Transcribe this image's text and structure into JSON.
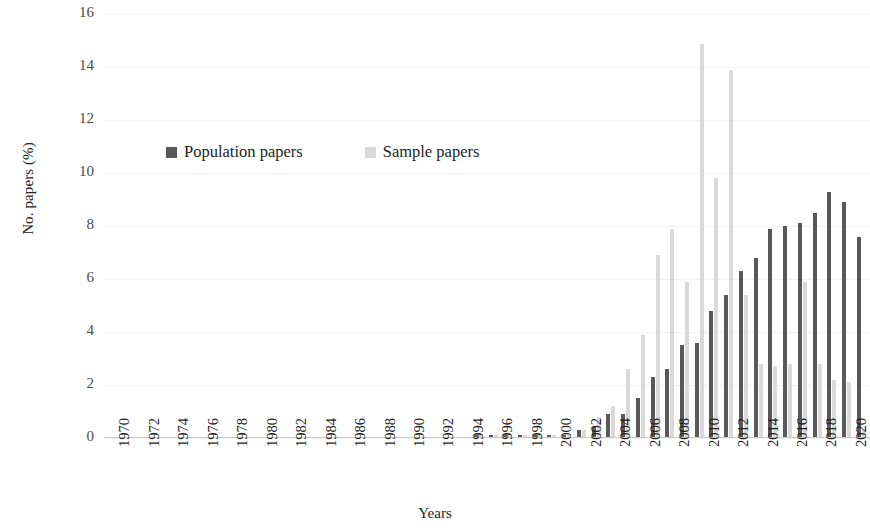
{
  "chart": {
    "type": "bar",
    "ylabel": "No. papers (%)",
    "xlabel": "Years"
  },
  "legend": {
    "position": "inside-top-left",
    "items": [
      {
        "label": "Population papers",
        "color": "#595959",
        "key": "population"
      },
      {
        "label": "Sample papers",
        "color": "#d9d9d9",
        "key": "sample"
      }
    ]
  },
  "yaxis": {
    "ticks": [
      "0",
      "2",
      "4",
      "6",
      "8",
      "10",
      "12",
      "14",
      "16"
    ],
    "min": 0,
    "max": 16,
    "step": 2
  },
  "xaxis": {
    "ticks": [
      "1970",
      "1972",
      "1974",
      "1976",
      "1978",
      "1980",
      "1982",
      "1984",
      "1986",
      "1988",
      "1990",
      "1992",
      "1994",
      "1996",
      "1998",
      "2000",
      "2002",
      "2004",
      "2006",
      "2008",
      "2010",
      "2012",
      "2014",
      "2016",
      "2018",
      "2020"
    ],
    "min": 1970,
    "max": 2021
  },
  "chart_data": {
    "type": "bar",
    "title": "",
    "xlabel": "Years",
    "ylabel": "No. papers (%)",
    "ylim": [
      0,
      16
    ],
    "grid": true,
    "legend_position": "inside-top-left",
    "categories": [
      "1970",
      "1971",
      "1972",
      "1973",
      "1974",
      "1975",
      "1976",
      "1977",
      "1978",
      "1979",
      "1980",
      "1981",
      "1982",
      "1983",
      "1984",
      "1985",
      "1986",
      "1987",
      "1988",
      "1989",
      "1990",
      "1991",
      "1992",
      "1993",
      "1994",
      "1995",
      "1996",
      "1997",
      "1998",
      "1999",
      "2000",
      "2001",
      "2002",
      "2003",
      "2004",
      "2005",
      "2006",
      "2007",
      "2008",
      "2009",
      "2010",
      "2011",
      "2012",
      "2013",
      "2014",
      "2015",
      "2016",
      "2017",
      "2018",
      "2019",
      "2020",
      "2021"
    ],
    "series": [
      {
        "name": "Population papers",
        "color": "#595959",
        "values": [
          0,
          0,
          0,
          0,
          0,
          0,
          0,
          0,
          0,
          0,
          0,
          0,
          0,
          0,
          0,
          0,
          0,
          0,
          0,
          0,
          0,
          0,
          0,
          0,
          0,
          0.1,
          0.1,
          0.1,
          0.1,
          0.1,
          0.1,
          0.1,
          0.3,
          0.4,
          0.9,
          0.9,
          1.5,
          2.3,
          2.6,
          3.5,
          3.6,
          4.8,
          5.4,
          6.3,
          6.8,
          7.9,
          8.0,
          8.1,
          8.5,
          9.3,
          8.9,
          7.6
        ]
      },
      {
        "name": "Sample papers",
        "color": "#d9d9d9",
        "values": [
          0,
          0,
          0,
          0,
          0,
          0,
          0,
          0,
          0,
          0,
          0,
          0,
          0,
          0,
          0,
          0,
          0,
          0,
          0,
          0,
          0,
          0,
          0,
          0,
          0,
          0.1,
          0.1,
          0.1,
          0.1,
          0.1,
          0.1,
          0.1,
          0.3,
          0.8,
          1.2,
          2.6,
          3.9,
          6.9,
          7.9,
          5.9,
          14.85,
          9.8,
          13.9,
          5.4,
          2.8,
          2.7,
          2.8,
          5.9,
          2.8,
          2.2,
          2.1,
          0.3
        ]
      }
    ]
  }
}
